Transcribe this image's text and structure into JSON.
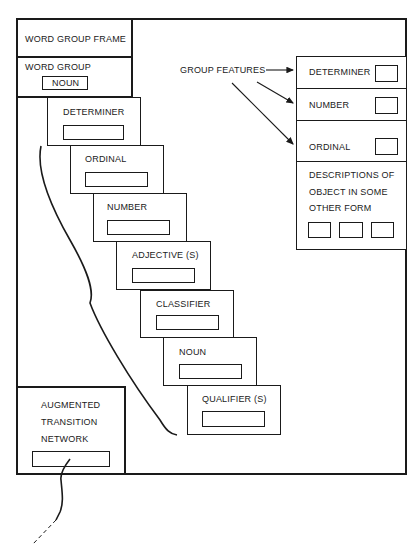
{
  "diagram": {
    "frame_title": "WORD GROUP FRAME",
    "word_group": {
      "label": "WORD GROUP",
      "value": "NOUN"
    },
    "slots": [
      {
        "label": "DETERMINER"
      },
      {
        "label": "ORDINAL"
      },
      {
        "label": "NUMBER"
      },
      {
        "label": "ADJECTIVE (S)"
      },
      {
        "label": "CLASSIFIER"
      },
      {
        "label": "NOUN"
      },
      {
        "label": "QUALIFIER (S)"
      }
    ],
    "group_features": {
      "label": "GROUP FEATURES",
      "features": [
        {
          "label": "DETERMINER"
        },
        {
          "label": "NUMBER"
        },
        {
          "label": "ORDINAL"
        }
      ],
      "descriptions": {
        "line1": "DESCRIPTIONS OF",
        "line2": "OBJECT IN SOME",
        "line3": "OTHER FORM"
      }
    },
    "atn": {
      "line1": "AUGMENTED",
      "line2": "TRANSITION",
      "line3": "NETWORK"
    }
  }
}
